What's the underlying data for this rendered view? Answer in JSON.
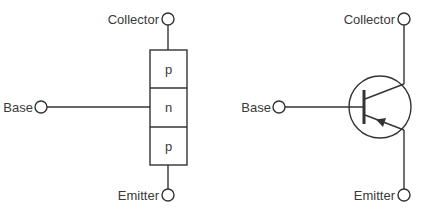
{
  "diagram": {
    "left": {
      "title": "PNP layer structure",
      "terminals": {
        "collector": "Collector",
        "base": "Base",
        "emitter": "Emitter"
      },
      "layers": [
        "p",
        "n",
        "p"
      ]
    },
    "right": {
      "title": "PNP transistor symbol",
      "terminals": {
        "collector": "Collector",
        "base": "Base",
        "emitter": "Emitter"
      },
      "arrow_direction": "into base (emitter)"
    },
    "colors": {
      "line": "#333333",
      "text": "#3a3a3a",
      "background": "#ffffff"
    }
  }
}
